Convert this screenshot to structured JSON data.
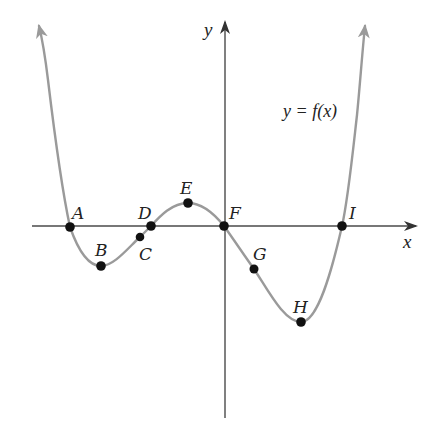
{
  "figure": {
    "equation_label": "y = f(x)",
    "x_axis_label": "x",
    "y_axis_label": "y",
    "curve_color": "#9a9a9a",
    "axis_color": "#4a4a4a",
    "point_color": "#111111"
  },
  "points": [
    {
      "label": "A",
      "description": "x-intercept (root)"
    },
    {
      "label": "B",
      "description": "local minimum"
    },
    {
      "label": "C",
      "description": "point on curve below x-axis"
    },
    {
      "label": "D",
      "description": "x-intercept (root)"
    },
    {
      "label": "E",
      "description": "local maximum"
    },
    {
      "label": "F",
      "description": "origin, x-intercept"
    },
    {
      "label": "G",
      "description": "point on curve below x-axis"
    },
    {
      "label": "H",
      "description": "local minimum"
    },
    {
      "label": "I",
      "description": "x-intercept (root)"
    }
  ]
}
